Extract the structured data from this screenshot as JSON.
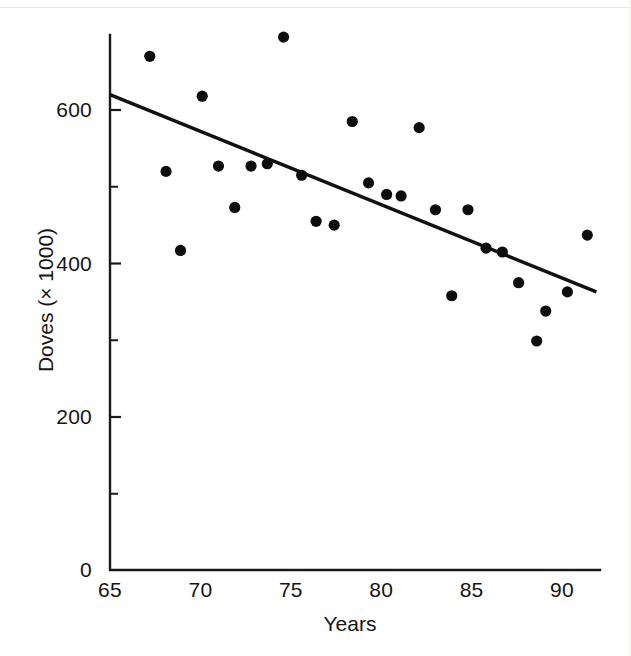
{
  "chart_data": {
    "type": "scatter",
    "title": "",
    "xlabel": "Years",
    "ylabel": "Doves (× 1000)",
    "xlim": [
      65,
      92
    ],
    "ylim": [
      0,
      700
    ],
    "xticks": [
      65,
      70,
      75,
      80,
      85,
      90
    ],
    "xtick_labels": [
      "65",
      "70",
      "75",
      "80",
      "85",
      "90"
    ],
    "yticks": [
      0,
      200,
      400,
      600
    ],
    "ytick_labels": [
      "0",
      "200",
      "400",
      "600"
    ],
    "yticks_minor": [
      100,
      300,
      500,
      700
    ],
    "grid": false,
    "legend": null,
    "series": [
      {
        "name": "Dove counts",
        "marker": "filled-circle",
        "color": "#0d0d0d",
        "points": [
          {
            "x": 67.2,
            "y": 670
          },
          {
            "x": 68.1,
            "y": 520
          },
          {
            "x": 68.9,
            "y": 417
          },
          {
            "x": 70.1,
            "y": 618
          },
          {
            "x": 71.0,
            "y": 527
          },
          {
            "x": 71.9,
            "y": 473
          },
          {
            "x": 72.8,
            "y": 527
          },
          {
            "x": 73.7,
            "y": 530
          },
          {
            "x": 74.6,
            "y": 695
          },
          {
            "x": 75.6,
            "y": 515
          },
          {
            "x": 76.4,
            "y": 455
          },
          {
            "x": 77.4,
            "y": 450
          },
          {
            "x": 78.4,
            "y": 585
          },
          {
            "x": 79.3,
            "y": 505
          },
          {
            "x": 80.3,
            "y": 490
          },
          {
            "x": 81.1,
            "y": 488
          },
          {
            "x": 82.1,
            "y": 577
          },
          {
            "x": 83.0,
            "y": 470
          },
          {
            "x": 83.9,
            "y": 358
          },
          {
            "x": 84.8,
            "y": 470
          },
          {
            "x": 85.8,
            "y": 420
          },
          {
            "x": 86.7,
            "y": 415
          },
          {
            "x": 87.6,
            "y": 375
          },
          {
            "x": 88.6,
            "y": 299
          },
          {
            "x": 89.1,
            "y": 338
          },
          {
            "x": 90.3,
            "y": 363
          },
          {
            "x": 91.4,
            "y": 437
          }
        ]
      }
    ],
    "trendline": {
      "name": "least-squares fit",
      "color": "#111111",
      "x_start": 65.0,
      "y_start": 620,
      "x_end": 91.9,
      "y_end": 363
    }
  },
  "axes": {
    "x_title": "Years",
    "y_title": "Doves (× 1000)"
  }
}
